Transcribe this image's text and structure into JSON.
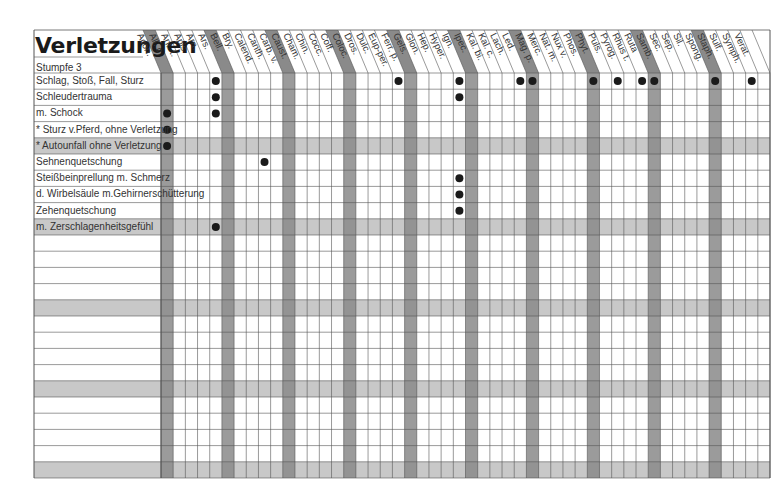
{
  "title": "Verletzungen",
  "subtitle": "Stumpfe 3",
  "colors": {
    "dark_band": "#8a8a8a",
    "light_band": "#c8c8c8",
    "grid_line": "#555555",
    "dot": "#1a1a1a"
  },
  "columns": [
    "Acon.",
    "All. c.",
    "Ant. t.",
    "Apis",
    "Arn.",
    "Ars.",
    "Bell.",
    "Bry.",
    "Calend.",
    "Canth.",
    "Carb. v.",
    "Caust.",
    "Cham.",
    "Chin.",
    "Cocc.",
    "Coff.",
    "Coloc.",
    "Dros.",
    "Dulc.",
    "Eup-per.",
    "Ferr. p.",
    "Gels.",
    "Glon.",
    "Hep.",
    "Hyper.",
    "Ign.",
    "Ipec.",
    "Kal. bi.",
    "Kal. c.",
    "Lach.",
    "Led.",
    "Mag. p.",
    "Merc.",
    "Nat. m.",
    "Nux v.",
    "Phos.",
    "Phyt.",
    "Puls.",
    "Pyrog.",
    "Rhus t.",
    "Ruta",
    "Samb.",
    "Sec.",
    "Sep.",
    "Sil.",
    "Spong.",
    "Staph.",
    "Sulf.",
    "Symph.",
    "Verat."
  ],
  "dark_columns": [
    0,
    5,
    10,
    15,
    20,
    25,
    30,
    35,
    40,
    45
  ],
  "rows": [
    {
      "label": "Schlag, Stoß, Fall, Sturz",
      "indent": false,
      "shaded": false,
      "dots": [
        4,
        19,
        24,
        29,
        30,
        35,
        37,
        39,
        40,
        45,
        48
      ]
    },
    {
      "label": "Schleudertrauma",
      "indent": false,
      "shaded": false,
      "dots": [
        4,
        24
      ]
    },
    {
      "label": "m. Schock",
      "indent": false,
      "shaded": false,
      "dots": [
        0,
        4
      ]
    },
    {
      "label": "* Sturz v.Pferd, ohne Verletzung",
      "indent": true,
      "shaded": false,
      "dots": [
        0
      ]
    },
    {
      "label": "* Autounfall ohne Verletzung",
      "indent": true,
      "shaded": true,
      "dots": [
        0
      ]
    },
    {
      "label": "Sehnenquetschung",
      "indent": false,
      "shaded": false,
      "dots": [
        8
      ]
    },
    {
      "label": "Steißbeinprellung m. Schmerz",
      "indent": false,
      "shaded": false,
      "dots": [
        24
      ]
    },
    {
      "label": "d. Wirbelsäule m.Gehirnerschütterung",
      "indent": false,
      "shaded": false,
      "dots": [
        24
      ]
    },
    {
      "label": "Zehenquetschung",
      "indent": false,
      "shaded": false,
      "dots": [
        24
      ]
    },
    {
      "label": "m. Zerschlagenheitsgefühl",
      "indent": false,
      "shaded": true,
      "dots": [
        4
      ]
    },
    {
      "label": "",
      "indent": false,
      "shaded": false,
      "dots": []
    },
    {
      "label": "",
      "indent": false,
      "shaded": false,
      "dots": []
    },
    {
      "label": "",
      "indent": false,
      "shaded": false,
      "dots": []
    },
    {
      "label": "",
      "indent": false,
      "shaded": false,
      "dots": []
    },
    {
      "label": "",
      "indent": false,
      "shaded": true,
      "dots": []
    },
    {
      "label": "",
      "indent": false,
      "shaded": false,
      "dots": []
    },
    {
      "label": "",
      "indent": false,
      "shaded": false,
      "dots": []
    },
    {
      "label": "",
      "indent": false,
      "shaded": false,
      "dots": []
    },
    {
      "label": "",
      "indent": false,
      "shaded": false,
      "dots": []
    },
    {
      "label": "",
      "indent": false,
      "shaded": true,
      "dots": []
    },
    {
      "label": "",
      "indent": false,
      "shaded": false,
      "dots": []
    },
    {
      "label": "",
      "indent": false,
      "shaded": false,
      "dots": []
    },
    {
      "label": "",
      "indent": false,
      "shaded": false,
      "dots": []
    },
    {
      "label": "",
      "indent": false,
      "shaded": false,
      "dots": []
    },
    {
      "label": "",
      "indent": false,
      "shaded": true,
      "dots": []
    }
  ]
}
